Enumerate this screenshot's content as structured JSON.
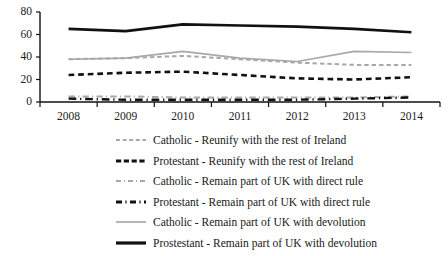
{
  "chart_data": {
    "type": "line",
    "title": "",
    "xlabel": "",
    "ylabel": "",
    "categories": [
      "2008",
      "2009",
      "2010",
      "2011",
      "2012",
      "2013",
      "2014"
    ],
    "ylim": [
      0,
      80
    ],
    "yticks": [
      0,
      20,
      40,
      60,
      80
    ],
    "grid": false,
    "legend_position": "bottom",
    "series": [
      {
        "name": "Catholic  - Reunify with the rest of Ireland",
        "style": "dashed",
        "color": "#a8a8a8",
        "width": 2,
        "values": [
          38,
          39,
          41,
          38,
          35,
          33,
          33
        ]
      },
      {
        "name": "Protestant - Reunify with the rest of Ireland",
        "style": "dashed",
        "color": "#111111",
        "width": 2.6,
        "values": [
          24,
          26,
          27,
          24,
          21,
          20,
          22
        ]
      },
      {
        "name": "Catholic - Remain part of UK with direct rule",
        "style": "dashdot",
        "color": "#a8a8a8",
        "width": 2,
        "values": [
          5,
          5,
          4,
          4,
          4,
          4,
          5
        ]
      },
      {
        "name": "Protestant - Remain part of UK with direct rule",
        "style": "dashdot",
        "color": "#111111",
        "width": 2.4,
        "values": [
          3,
          2,
          2,
          2,
          2,
          3,
          4
        ]
      },
      {
        "name": "Catholic - Remain part of UK with devolution",
        "style": "solid",
        "color": "#a8a8a8",
        "width": 1.6,
        "values": [
          38,
          39,
          45,
          39,
          36,
          45,
          44
        ]
      },
      {
        "name": "Prostestant - Remain part of UK with devolution",
        "style": "solid",
        "color": "#111111",
        "width": 2.6,
        "values": [
          65,
          63,
          69,
          68,
          67,
          65,
          62
        ]
      }
    ]
  },
  "axis": {
    "y_labels": [
      "80",
      "60",
      "40",
      "20",
      "0"
    ],
    "x_labels": [
      "2008",
      "2009",
      "2010",
      "2011",
      "2012",
      "2013",
      "2014"
    ],
    "axis_color": "#111111"
  },
  "legend": {
    "items": [
      {
        "label": "Catholic  - Reunify with the rest of Ireland",
        "style": "dashed",
        "color": "#a8a8a8",
        "name": "legend-catholic-reunify"
      },
      {
        "label": "Protestant - Reunify with the rest of Ireland",
        "style": "dashed-bold",
        "color": "#111111",
        "name": "legend-protestant-reunify"
      },
      {
        "label": "Catholic - Remain part of UK with direct rule",
        "style": "dashdot",
        "color": "#a8a8a8",
        "name": "legend-catholic-direct-rule"
      },
      {
        "label": "Protestant - Remain part of UK with direct rule",
        "style": "dashdot-bold",
        "color": "#111111",
        "name": "legend-protestant-direct-rule"
      },
      {
        "label": "Catholic - Remain part of UK with devolution",
        "style": "solid",
        "color": "#a8a8a8",
        "name": "legend-catholic-devolution"
      },
      {
        "label": "Prostestant - Remain part of UK with devolution",
        "style": "solid-bold",
        "color": "#111111",
        "name": "legend-protestant-devolution"
      }
    ]
  }
}
